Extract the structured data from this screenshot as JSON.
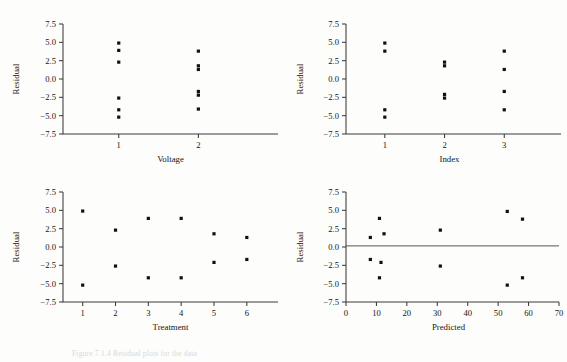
{
  "figure": {
    "caption": "Figure 7.1.4  Residual plots for the data",
    "background": "#fdfdfb",
    "point_color": "#111111",
    "axis_color": "#3a3a3a"
  },
  "chart_data": [
    {
      "type": "scatter",
      "title": "",
      "panel": "top-left",
      "xlabel": "Voltage",
      "ylabel": "Residual",
      "xticks": [
        1,
        2
      ],
      "xticklabels": [
        "1",
        "2"
      ],
      "xlim": [
        0.3,
        3.0
      ],
      "yticks": [
        -7.5,
        -5.0,
        -2.5,
        0.0,
        2.5,
        5.0,
        7.5
      ],
      "yticklabels": [
        "-7.5",
        "-5.0",
        "-2.5",
        "0.0",
        "2.5",
        "5.0",
        "7.5"
      ],
      "ylim": [
        -7.5,
        7.5
      ],
      "grid": false,
      "legend": "none",
      "points": [
        {
          "x": 1,
          "y": 4.9
        },
        {
          "x": 1,
          "y": 3.9
        },
        {
          "x": 1,
          "y": 2.3
        },
        {
          "x": 1,
          "y": -2.6
        },
        {
          "x": 1,
          "y": -4.2
        },
        {
          "x": 1,
          "y": -5.2
        },
        {
          "x": 2,
          "y": 3.8
        },
        {
          "x": 2,
          "y": 1.8
        },
        {
          "x": 2,
          "y": 1.3
        },
        {
          "x": 2,
          "y": -1.7
        },
        {
          "x": 2,
          "y": -2.2
        },
        {
          "x": 2,
          "y": -4.1
        }
      ]
    },
    {
      "type": "scatter",
      "title": "",
      "panel": "top-right",
      "xlabel": "Index",
      "ylabel": "Residual",
      "xticks": [
        1,
        2,
        3
      ],
      "xticklabels": [
        "1",
        "2",
        "3"
      ],
      "xlim": [
        0.35,
        3.95
      ],
      "yticks": [
        -7.5,
        -5.0,
        -2.5,
        0.0,
        2.5,
        5.0,
        7.5
      ],
      "yticklabels": [
        "-7.5",
        "-5.0",
        "-2.5",
        "0.0",
        "2.5",
        "5.0",
        "7.5"
      ],
      "ylim": [
        -7.5,
        7.5
      ],
      "grid": false,
      "legend": "none",
      "points": [
        {
          "x": 1,
          "y": 4.9
        },
        {
          "x": 1,
          "y": 3.8
        },
        {
          "x": 1,
          "y": -4.2
        },
        {
          "x": 1,
          "y": -5.2
        },
        {
          "x": 2,
          "y": 2.3
        },
        {
          "x": 2,
          "y": 1.8
        },
        {
          "x": 2,
          "y": -2.1
        },
        {
          "x": 2,
          "y": -2.6
        },
        {
          "x": 3,
          "y": 3.8
        },
        {
          "x": 3,
          "y": 1.3
        },
        {
          "x": 3,
          "y": -1.7
        },
        {
          "x": 3,
          "y": -4.2
        }
      ]
    },
    {
      "type": "scatter",
      "title": "",
      "panel": "bottom-left",
      "xlabel": "Treatment",
      "ylabel": "Residual",
      "xticks": [
        1,
        2,
        3,
        4,
        5,
        6
      ],
      "xticklabels": [
        "1",
        "2",
        "3",
        "4",
        "5",
        "6"
      ],
      "xlim": [
        0.4,
        6.95
      ],
      "yticks": [
        -7.5,
        -5.0,
        -2.5,
        0.0,
        2.5,
        5.0,
        7.5
      ],
      "yticklabels": [
        "-7.5",
        "-5.0",
        "-2.5",
        "0.0",
        "2.5",
        "5.0",
        "7.5"
      ],
      "ylim": [
        -7.5,
        7.5
      ],
      "grid": false,
      "legend": "none",
      "points": [
        {
          "x": 1,
          "y": 4.9
        },
        {
          "x": 1,
          "y": -5.2
        },
        {
          "x": 2,
          "y": 2.3
        },
        {
          "x": 2,
          "y": -2.6
        },
        {
          "x": 3,
          "y": 3.9
        },
        {
          "x": 3,
          "y": -4.2
        },
        {
          "x": 4,
          "y": 3.9
        },
        {
          "x": 4,
          "y": -4.2
        },
        {
          "x": 5,
          "y": 1.8
        },
        {
          "x": 5,
          "y": -2.1
        },
        {
          "x": 6,
          "y": 1.3
        },
        {
          "x": 6,
          "y": -1.7
        }
      ]
    },
    {
      "type": "scatter",
      "title": "",
      "panel": "bottom-right",
      "xlabel": "Predicted",
      "ylabel": "Residual",
      "xticks": [
        0,
        10,
        20,
        30,
        40,
        50,
        60,
        70
      ],
      "xticklabels": [
        "0",
        "10",
        "20",
        "30",
        "40",
        "50",
        "60",
        "70"
      ],
      "xlim": [
        0,
        70
      ],
      "yticks": [
        -7.5,
        -5.0,
        -2.5,
        0.0,
        2.5,
        5.0,
        7.5
      ],
      "yticklabels": [
        "-7.5",
        "-5.0",
        "-2.5",
        "0.0",
        "2.5",
        "5.0",
        "7.5"
      ],
      "ylim": [
        -7.5,
        7.5
      ],
      "grid": false,
      "legend": "none",
      "reference_line": {
        "y": 0.15,
        "from_x": 0,
        "to_x": 70
      },
      "points": [
        {
          "x": 8,
          "y": 1.3
        },
        {
          "x": 11,
          "y": 3.9
        },
        {
          "x": 12.5,
          "y": 1.8
        },
        {
          "x": 8,
          "y": -1.7
        },
        {
          "x": 11.5,
          "y": -2.1
        },
        {
          "x": 11,
          "y": -4.2
        },
        {
          "x": 31,
          "y": 2.3
        },
        {
          "x": 31,
          "y": -2.6
        },
        {
          "x": 53,
          "y": 4.85
        },
        {
          "x": 58,
          "y": 3.8
        },
        {
          "x": 53,
          "y": -5.2
        },
        {
          "x": 58,
          "y": -4.2
        }
      ]
    }
  ]
}
